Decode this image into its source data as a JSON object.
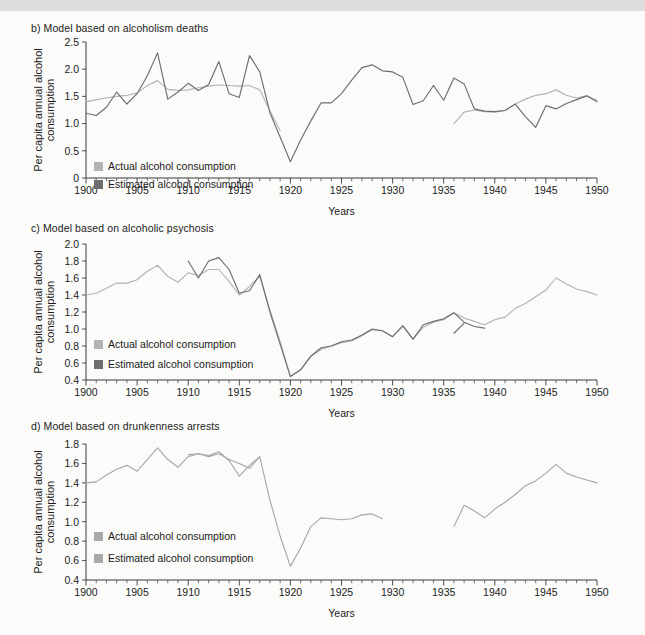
{
  "page": {
    "background_color": "#fbfbfa",
    "top_band_color": "#d7d7d7"
  },
  "legend": {
    "actual_label": "Actual alcohol consumption",
    "estimated_label": "Estimated alcohol consumption",
    "actual_color": "#b3b3b3",
    "estimated_color": "#6e6e6e"
  },
  "axis": {
    "xlabel": "Years",
    "ylabel": "Per capita annual alcohol\nconsumption",
    "ylabel_line1": "Per capita annual alcohol",
    "ylabel_line2": "consumption"
  },
  "chart_data": [
    {
      "id": "panel-b",
      "type": "line",
      "title": "b) Model based on alcoholism deaths",
      "xlabel": "Years",
      "ylabel": "Per capita annual alcohol consumption",
      "xlim": [
        1900,
        1950
      ],
      "ylim": [
        0,
        2.5
      ],
      "yticks": [
        0,
        0.5,
        1.0,
        1.5,
        2.0,
        2.5
      ],
      "ytick_labels": [
        "0",
        "0.5",
        "1.0",
        "1.5",
        "2.0",
        "2.5"
      ],
      "xticks": [
        1900,
        1905,
        1910,
        1915,
        1920,
        1925,
        1930,
        1935,
        1940,
        1945,
        1950
      ],
      "xtick_minor_step": 1,
      "grid": false,
      "legend_position": "inside-bottom-left",
      "series": [
        {
          "name": "Actual alcohol consumption",
          "color": "#b3b3b3",
          "segments": [
            {
              "x": [
                1900,
                1901,
                1902,
                1903,
                1904,
                1905,
                1906,
                1907,
                1908,
                1909,
                1910,
                1911,
                1912,
                1913,
                1914,
                1915,
                1916,
                1917,
                1918,
                1919
              ],
              "values": [
                1.4,
                1.44,
                1.47,
                1.5,
                1.52,
                1.56,
                1.7,
                1.79,
                1.63,
                1.61,
                1.62,
                1.66,
                1.69,
                1.71,
                1.7,
                1.69,
                1.7,
                1.62,
                1.23,
                0.87
              ]
            },
            {
              "x": [
                1936,
                1937,
                1938,
                1939,
                1940,
                1941,
                1942,
                1943,
                1944,
                1945,
                1946,
                1947,
                1948,
                1949,
                1950
              ],
              "values": [
                1.0,
                1.21,
                1.25,
                1.22,
                1.21,
                1.24,
                1.36,
                1.45,
                1.52,
                1.55,
                1.62,
                1.52,
                1.47,
                1.51,
                1.43
              ]
            }
          ]
        },
        {
          "name": "Estimated alcohol consumption",
          "color": "#6e6e6e",
          "segments": [
            {
              "x": [
                1900,
                1901,
                1902,
                1903,
                1904,
                1905,
                1906,
                1907,
                1908,
                1909,
                1910,
                1911,
                1912,
                1913,
                1914,
                1915,
                1916,
                1917,
                1918,
                1919,
                1920,
                1921,
                1922,
                1923,
                1924,
                1925,
                1926,
                1927,
                1928,
                1929,
                1930,
                1931,
                1932,
                1933,
                1934,
                1935,
                1936,
                1937,
                1938,
                1939,
                1940,
                1941,
                1942,
                1943,
                1944,
                1945,
                1946,
                1947,
                1948,
                1949,
                1950
              ],
              "values": [
                1.19,
                1.15,
                1.3,
                1.58,
                1.36,
                1.55,
                1.88,
                2.3,
                1.45,
                1.58,
                1.74,
                1.61,
                1.72,
                2.14,
                1.55,
                1.48,
                2.25,
                1.95,
                1.2,
                0.75,
                0.3,
                0.7,
                1.05,
                1.38,
                1.38,
                1.55,
                1.8,
                2.03,
                2.08,
                1.97,
                1.95,
                1.85,
                1.35,
                1.42,
                1.7,
                1.43,
                1.84,
                1.73,
                1.27,
                1.23,
                1.22,
                1.24,
                1.36,
                1.13,
                0.93,
                1.33,
                1.27,
                1.37,
                1.44,
                1.51,
                1.4
              ]
            }
          ]
        }
      ]
    },
    {
      "id": "panel-c",
      "type": "line",
      "title": "c) Model based on alcoholic psychosis",
      "xlabel": "Years",
      "ylabel": "Per capita annual alcohol consumption",
      "xlim": [
        1900,
        1950
      ],
      "ylim": [
        0.4,
        2.0
      ],
      "yticks": [
        0.4,
        0.6,
        0.8,
        1.0,
        1.2,
        1.4,
        1.6,
        1.8,
        2.0
      ],
      "ytick_labels": [
        "0.4",
        "0.6",
        "0.8",
        "1.0",
        "1.2",
        "1.4",
        "1.6",
        "1.8",
        "2.0"
      ],
      "xticks": [
        1900,
        1905,
        1910,
        1915,
        1920,
        1925,
        1930,
        1935,
        1940,
        1945,
        1950
      ],
      "xtick_minor_step": 1,
      "grid": false,
      "legend_position": "inside-bottom-left",
      "series": [
        {
          "name": "Actual alcohol consumption",
          "color": "#b3b3b3",
          "segments": [
            {
              "x": [
                1900,
                1901,
                1902,
                1903,
                1904,
                1905,
                1906,
                1907,
                1908,
                1909,
                1910,
                1911,
                1912,
                1913,
                1914,
                1915,
                1916,
                1917,
                1918,
                1919,
                1920,
                1921,
                1922,
                1923,
                1924,
                1925,
                1926,
                1927,
                1928,
                1929,
                1930,
                1931,
                1932,
                1933,
                1934,
                1935,
                1936,
                1937,
                1938,
                1939,
                1940,
                1941,
                1942,
                1943,
                1944,
                1945,
                1946,
                1947,
                1948,
                1949,
                1950
              ],
              "values": [
                1.4,
                1.42,
                1.48,
                1.54,
                1.54,
                1.58,
                1.68,
                1.75,
                1.62,
                1.55,
                1.66,
                1.63,
                1.7,
                1.7,
                1.56,
                1.4,
                1.5,
                1.62,
                1.22,
                0.85,
                0.44,
                0.52,
                0.68,
                0.76,
                0.8,
                0.84,
                0.86,
                0.92,
                0.99,
                0.98,
                0.91,
                1.03,
                0.88,
                1.02,
                1.08,
                1.11,
                1.19,
                1.13,
                1.09,
                1.05,
                1.11,
                1.14,
                1.24,
                1.3,
                1.38,
                1.46,
                1.6,
                1.53,
                1.47,
                1.44,
                1.4
              ]
            }
          ]
        },
        {
          "name": "Estimated alcohol consumption",
          "color": "#6e6e6e",
          "segments": [
            {
              "x": [
                1910,
                1911,
                1912,
                1913,
                1914,
                1915,
                1916,
                1917,
                1918,
                1919,
                1920,
                1921,
                1922,
                1923,
                1924,
                1925,
                1926,
                1927,
                1928,
                1929,
                1930,
                1931,
                1932,
                1933,
                1934,
                1935,
                1936,
                1937,
                1938,
                1939
              ],
              "values": [
                1.8,
                1.6,
                1.8,
                1.84,
                1.7,
                1.42,
                1.45,
                1.64,
                1.2,
                0.82,
                0.44,
                0.52,
                0.68,
                0.78,
                0.8,
                0.85,
                0.87,
                0.93,
                1.0,
                0.98,
                0.91,
                1.04,
                0.88,
                1.05,
                1.09,
                1.12,
                1.19,
                1.08,
                1.03,
                1.01
              ]
            },
            {
              "x": [
                1936,
                1937
              ],
              "values": [
                0.95,
                1.07
              ]
            }
          ]
        }
      ]
    },
    {
      "id": "panel-d",
      "type": "line",
      "title": "d) Model based on drunkenness arrests",
      "xlabel": "Years",
      "ylabel": "Per capita annual alcohol consumption",
      "xlim": [
        1900,
        1950
      ],
      "ylim": [
        0.4,
        1.8
      ],
      "yticks": [
        0.4,
        0.6,
        0.8,
        1.0,
        1.2,
        1.4,
        1.6,
        1.8
      ],
      "ytick_labels": [
        "0.4",
        "0.6",
        "0.8",
        "1.0",
        "1.2",
        "1.4",
        "1.6",
        "1.8"
      ],
      "xticks": [
        1900,
        1905,
        1910,
        1915,
        1920,
        1925,
        1930,
        1935,
        1940,
        1945,
        1950
      ],
      "xtick_minor_step": 1,
      "grid": false,
      "legend_position": "inside-bottom-left",
      "series": [
        {
          "name": "Actual alcohol consumption",
          "color": "#a8a8a8",
          "segments": [
            {
              "x": [
                1900,
                1901,
                1902,
                1903,
                1904,
                1905,
                1906,
                1907,
                1908,
                1909,
                1910,
                1911,
                1912,
                1913,
                1914,
                1915,
                1916,
                1917,
                1918,
                1919,
                1920,
                1921,
                1922,
                1923,
                1924,
                1925,
                1926,
                1927,
                1928,
                1929
              ],
              "values": [
                1.4,
                1.41,
                1.48,
                1.54,
                1.58,
                1.52,
                1.64,
                1.76,
                1.64,
                1.56,
                1.67,
                1.7,
                1.68,
                1.72,
                1.63,
                1.47,
                1.58,
                1.67,
                1.22,
                0.85,
                0.54,
                0.73,
                0.95,
                1.04,
                1.03,
                1.02,
                1.03,
                1.07,
                1.08,
                1.03
              ]
            },
            {
              "x": [
                1936,
                1937,
                1938,
                1939,
                1940,
                1941,
                1942,
                1943,
                1944,
                1945,
                1946,
                1947,
                1948,
                1949,
                1950
              ],
              "values": [
                0.95,
                1.17,
                1.11,
                1.04,
                1.13,
                1.2,
                1.28,
                1.37,
                1.42,
                1.5,
                1.59,
                1.5,
                1.46,
                1.43,
                1.4
              ]
            }
          ]
        },
        {
          "name": "Estimated alcohol consumption",
          "color": "#a8a8a8",
          "segments": [
            {
              "x": [
                1910,
                1911,
                1912,
                1913,
                1914,
                1915,
                1916,
                1917
              ],
              "values": [
                1.69,
                1.7,
                1.67,
                1.7,
                1.64,
                1.6,
                1.55,
                1.67
              ]
            }
          ]
        }
      ]
    }
  ]
}
